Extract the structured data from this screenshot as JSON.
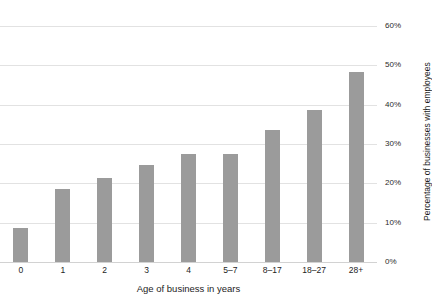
{
  "chart_data": {
    "type": "bar",
    "title": "",
    "subtitle": "",
    "xlabel": "Age of business in years",
    "ylabel": "Percentage of businesses with employees",
    "categories": [
      "0",
      "1",
      "2",
      "3",
      "4",
      "5–7",
      "8–17",
      "18–27",
      "28+"
    ],
    "values": [
      8.6,
      18.5,
      21.3,
      24.6,
      27.4,
      27.4,
      33.5,
      38.6,
      48.3
    ],
    "ylim": [
      0,
      60
    ],
    "ytick_values": [
      0,
      10,
      20,
      30,
      40,
      50,
      60
    ],
    "ytick_labels": [
      "0%",
      "10%",
      "20%",
      "30%",
      "40%",
      "50%",
      "60%"
    ],
    "grid": true,
    "grid_axis": "y",
    "legend": false,
    "legend_position": "none",
    "bar_color": "#9b9b9b",
    "gridline_color": "#e2e2e2",
    "background_color": "#ffffff",
    "value_format": "percent"
  },
  "axes": {
    "y_tick_labels": [
      "60%",
      "50%",
      "40%",
      "30%",
      "20%",
      "10%",
      "0%"
    ],
    "y_title": "Percentage of businesses with employees",
    "x_tick_labels": [
      "0",
      "1",
      "2",
      "3",
      "4",
      "5–7",
      "8–17",
      "18–27",
      "28+"
    ],
    "x_title": "Age of business in years"
  }
}
